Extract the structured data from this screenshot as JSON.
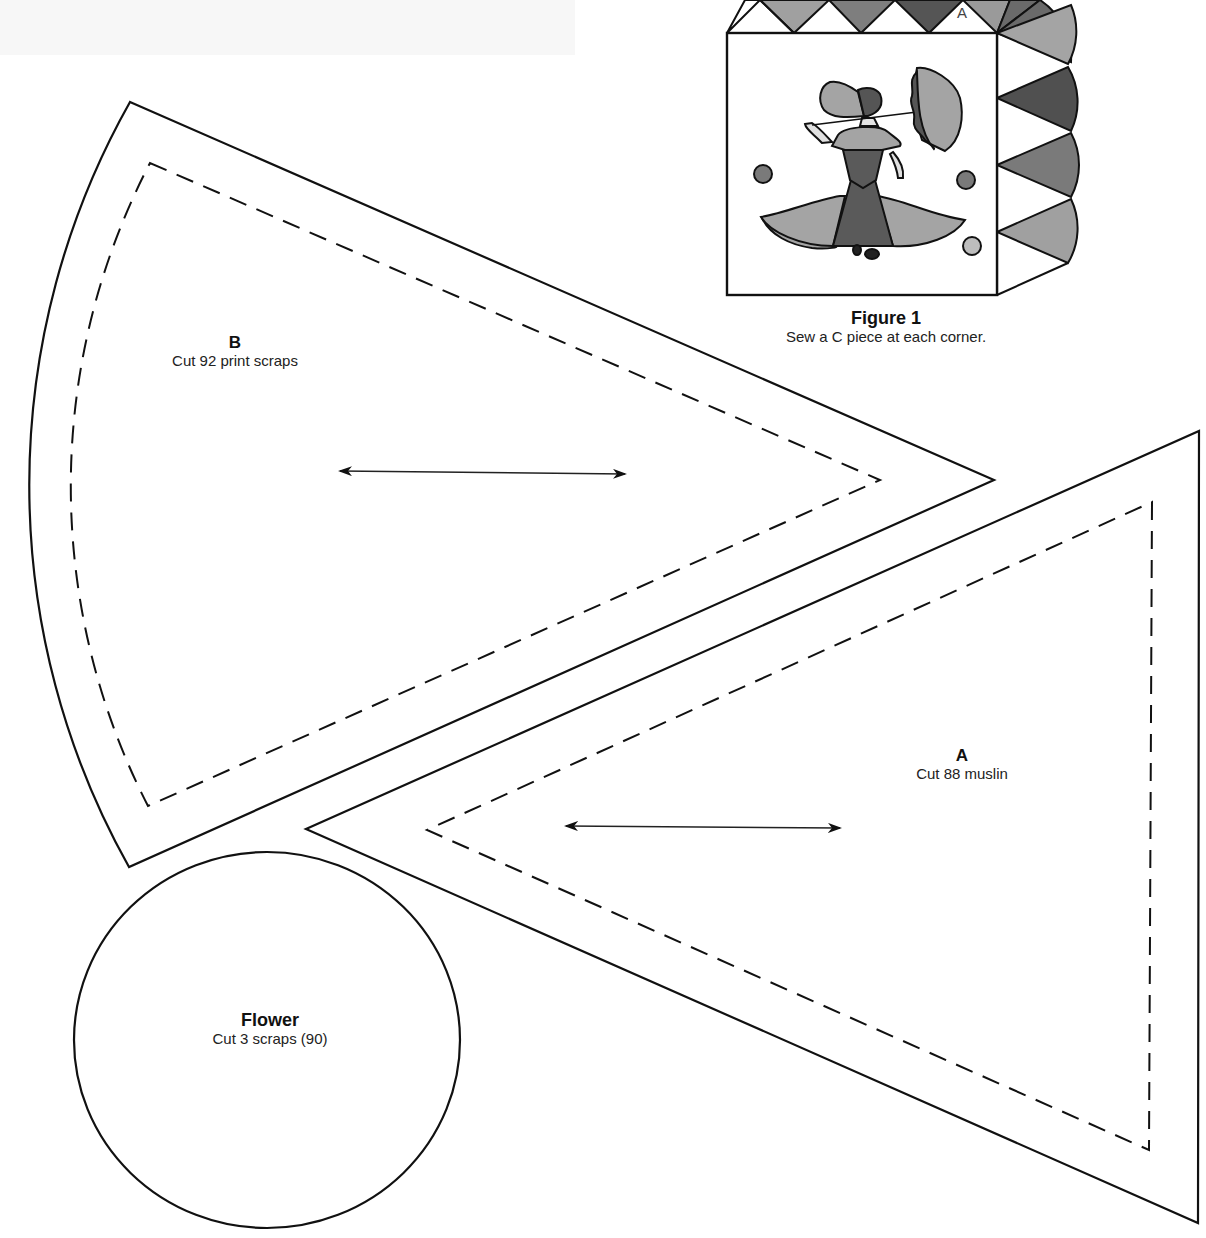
{
  "figure": {
    "title": "Figure 1",
    "caption": "Sew a C piece at each corner.",
    "block_label": "A",
    "colors": {
      "light_gray": "#a8a8a8",
      "mid_gray": "#8a8a8a",
      "dark_gray": "#5a5a5a",
      "outline": "#111111"
    }
  },
  "pieces": [
    {
      "id": "B",
      "label": "B",
      "instruction": "Cut 92 print scraps",
      "shape": "wedge",
      "has_grain_arrow": true
    },
    {
      "id": "A",
      "label": "A",
      "instruction": "Cut 88 muslin",
      "shape": "triangle",
      "has_grain_arrow": true
    },
    {
      "id": "Flower",
      "label": "Flower",
      "instruction": "Cut 3 scraps (90)",
      "shape": "circle",
      "has_grain_arrow": false
    }
  ]
}
